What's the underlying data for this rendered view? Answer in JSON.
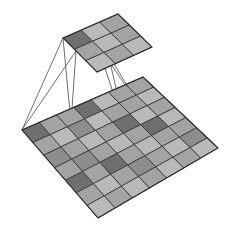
{
  "figure": {
    "background_color": "#ffffff",
    "line_color": "#4a4a4a",
    "cell_border_color": "#3a3a3a"
  },
  "input_plane": {
    "name": "input-feature-map",
    "rows": 7,
    "cols": 7,
    "corners": {
      "left": [
        22,
        130
      ],
      "top": [
        143,
        77
      ],
      "right": [
        218,
        148
      ],
      "bottom": [
        98,
        218
      ]
    },
    "palette": {
      "light": "#b9b9b9",
      "mid": "#a3a3a3",
      "dark": "#8d8d8d",
      "darker": "#6f6f6f",
      "darkest": "#5e5e5e"
    },
    "shades": [
      [
        "#6f6f6f",
        "#a3a3a3",
        "#a3a3a3",
        "#6f6f6f",
        "#b9b9b9",
        "#a3a3a3",
        "#a3a3a3"
      ],
      [
        "#a3a3a3",
        "#b9b9b9",
        "#8d8d8d",
        "#b9b9b9",
        "#a3a3a3",
        "#a3a3a3",
        "#b9b9b9"
      ],
      [
        "#8d8d8d",
        "#a3a3a3",
        "#b9b9b9",
        "#a3a3a3",
        "#6f6f6f",
        "#b9b9b9",
        "#a3a3a3"
      ],
      [
        "#a3a3a3",
        "#8d8d8d",
        "#a3a3a3",
        "#b9b9b9",
        "#a3a3a3",
        "#6f6f6f",
        "#b9b9b9"
      ],
      [
        "#6f6f6f",
        "#a3a3a3",
        "#6f6f6f",
        "#a3a3a3",
        "#b9b9b9",
        "#a3a3a3",
        "#a3a3a3"
      ],
      [
        "#a3a3a3",
        "#b9b9b9",
        "#a3a3a3",
        "#8d8d8d",
        "#a3a3a3",
        "#b9b9b9",
        "#8d8d8d"
      ],
      [
        "#b9b9b9",
        "#a3a3a3",
        "#b9b9b9",
        "#a3a3a3",
        "#b9b9b9",
        "#a3a3a3",
        "#b9b9b9"
      ]
    ]
  },
  "output_plane": {
    "name": "output-feature-map",
    "rows": 3,
    "cols": 3,
    "corners": {
      "left": [
        63,
        38
      ],
      "top": [
        118,
        14
      ],
      "right": [
        152,
        47
      ],
      "bottom": [
        97,
        72
      ]
    },
    "shades": [
      [
        "#6f6f6f",
        "#b9b9b9",
        "#a3a3a3"
      ],
      [
        "#a3a3a3",
        "#b9b9b9",
        "#a3a3a3"
      ],
      [
        "#b9b9b9",
        "#a3a3a3",
        "#b9b9b9"
      ]
    ]
  },
  "projection_lines": {
    "name": "receptive-field-lines",
    "description": "Lines mapping the highlighted output cell back to its receptive field on the input plane",
    "segments": [
      {
        "from": [
          63,
          38
        ],
        "to": [
          22,
          130
        ]
      },
      {
        "from": [
          63,
          38
        ],
        "to": [
          71,
          123
        ]
      },
      {
        "from": [
          76,
          51
        ],
        "to": [
          22,
          130
        ]
      },
      {
        "from": [
          76,
          51
        ],
        "to": [
          71,
          123
        ]
      },
      {
        "from": [
          97,
          43
        ],
        "to": [
          145,
          115
        ]
      },
      {
        "from": [
          97,
          43
        ],
        "to": [
          129,
          142
        ]
      },
      {
        "from": [
          108,
          54
        ],
        "to": [
          145,
          115
        ]
      },
      {
        "from": [
          108,
          54
        ],
        "to": [
          129,
          142
        ]
      }
    ]
  }
}
